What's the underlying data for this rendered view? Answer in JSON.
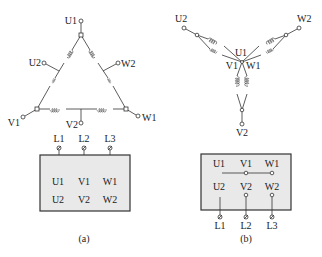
{
  "figure": {
    "colors": {
      "line": "#333333",
      "box_fill": "#e9e9e9",
      "background": "#ffffff"
    }
  },
  "delta": {
    "caption": "(a)",
    "terminals": {
      "U1": "U1",
      "U2": "U2",
      "V1": "V1",
      "V2": "V2",
      "W1": "W1",
      "W2": "W2"
    },
    "box": {
      "row1": [
        "U1",
        "V1",
        "W1"
      ],
      "row2": [
        "U2",
        "V2",
        "W2"
      ]
    },
    "lines": [
      "L1",
      "L2",
      "L3"
    ]
  },
  "star": {
    "caption": "(b)",
    "terminals": {
      "U1": "U1",
      "U2": "U2",
      "V1": "V1",
      "V2": "V2",
      "W1": "W1",
      "W2": "W2"
    },
    "box": {
      "row1": [
        "U1",
        "V1",
        "W1"
      ],
      "row2": [
        "U2",
        "V2",
        "W2"
      ]
    },
    "lines": [
      "L1",
      "L2",
      "L3"
    ]
  }
}
